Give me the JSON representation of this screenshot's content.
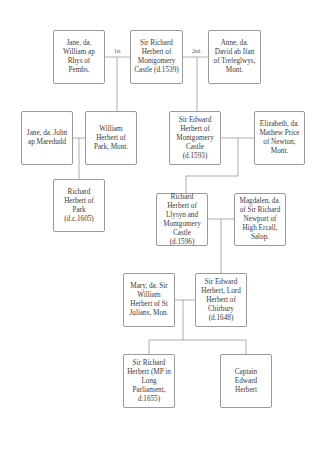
{
  "diagram": {
    "type": "family-tree",
    "marriage_labels": {
      "first": "1st",
      "second": "2nd"
    },
    "people": {
      "jane_rhys": "Jane, da. William ap Rhys of Pembs.",
      "richard_1539": "Sir Richard Herbert of Montgomery Castle (d.1539)",
      "anne_ifan": "Anne, da. David ab Ifan of Trefeglwys, Mont.",
      "jane_maredudd": "Jane, da. John ap Maredudd",
      "william_park": "William Herbert of Park, Mont.",
      "edward_1593": "Sir Edward Herbert of Montgomery Castle (d.1593)",
      "elizabeth_price": "Elizabeth, da. Mathew Price of Newton, Mont.",
      "richard_park": "Richard Herbert of Park (d.c.1605)",
      "richard_1596": "Richard Herbert of Llysyn and Montgomery Castle (d.1596)",
      "magdalen_newport": "Magdalen, da. of Sir Richard Newport of High Ercall, Salop.",
      "mary_herbert": "Mary, da. Sir William Herbert of St Julians, Mon.",
      "edward_1648": "Sir Edward Herbert, Lord Herbert of Chirbury (d.1648)",
      "richard_1655": "Sir Richard Herbert (MP in Long Parliament, d.1655)",
      "captain_edward": "Captain Edward Herbert"
    },
    "relationships": [
      {
        "type": "marriage",
        "a": "jane_rhys",
        "b": "richard_1539",
        "label": "1st"
      },
      {
        "type": "marriage",
        "a": "richard_1539",
        "b": "anne_ifan",
        "label": "2nd"
      },
      {
        "type": "child",
        "parents": [
          "jane_rhys",
          "richard_1539"
        ],
        "child": "william_park"
      },
      {
        "type": "child",
        "parents": [
          "richard_1539",
          "anne_ifan"
        ],
        "child": "edward_1593"
      },
      {
        "type": "marriage",
        "a": "jane_maredudd",
        "b": "william_park"
      },
      {
        "type": "child",
        "parents": [
          "jane_maredudd",
          "william_park"
        ],
        "child": "richard_park"
      },
      {
        "type": "marriage",
        "a": "edward_1593",
        "b": "elizabeth_price"
      },
      {
        "type": "child",
        "parents": [
          "edward_1593",
          "elizabeth_price"
        ],
        "child": "richard_1596"
      },
      {
        "type": "marriage",
        "a": "richard_1596",
        "b": "magdalen_newport"
      },
      {
        "type": "child",
        "parents": [
          "richard_1596",
          "magdalen_newport"
        ],
        "child": "edward_1648"
      },
      {
        "type": "marriage",
        "a": "mary_herbert",
        "b": "edward_1648"
      },
      {
        "type": "child",
        "parents": [
          "mary_herbert",
          "edward_1648"
        ],
        "child": "richard_1655"
      },
      {
        "type": "child",
        "parents": [
          "mary_herbert",
          "edward_1648"
        ],
        "child": "captain_edward"
      }
    ],
    "colors": {
      "line": "#9a9a9a",
      "border": "#9a9a9a",
      "text": "#3a3a3a",
      "background": "#ffffff"
    }
  }
}
